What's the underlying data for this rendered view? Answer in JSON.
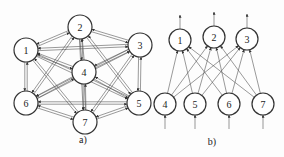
{
  "diagrams": [
    {
      "id": "a",
      "caption": "a)",
      "type": "fully-connected recurrent network (Hopfield-like)",
      "nodes": [
        {
          "label": "1",
          "x": 26,
          "y": 50
        },
        {
          "label": "2",
          "x": 80,
          "y": 27
        },
        {
          "label": "3",
          "x": 140,
          "y": 45
        },
        {
          "label": "4",
          "x": 84,
          "y": 72
        },
        {
          "label": "5",
          "x": 139,
          "y": 103
        },
        {
          "label": "6",
          "x": 26,
          "y": 103
        },
        {
          "label": "7",
          "x": 85,
          "y": 122
        }
      ],
      "edges": "bidirectional between every pair of nodes"
    },
    {
      "id": "b",
      "caption": "b)",
      "type": "two-layer feedforward network",
      "output_nodes": [
        {
          "label": "1",
          "x": 180,
          "y": 40
        },
        {
          "label": "2",
          "x": 214,
          "y": 37
        },
        {
          "label": "3",
          "x": 247,
          "y": 39
        }
      ],
      "input_nodes": [
        {
          "label": "4",
          "x": 165,
          "y": 104
        },
        {
          "label": "5",
          "x": 195,
          "y": 104
        },
        {
          "label": "6",
          "x": 229,
          "y": 104
        },
        {
          "label": "7",
          "x": 263,
          "y": 104
        }
      ],
      "edges": "every input node connects to every output node; arrows into inputs from below, arrows out of outputs upward"
    }
  ]
}
